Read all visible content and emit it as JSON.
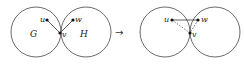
{
  "diagram": {
    "arrow": "→",
    "left": {
      "circles": [
        {
          "label": "G"
        },
        {
          "label": "H"
        }
      ],
      "vertices": {
        "u": "u",
        "v": "v",
        "w": "w"
      },
      "edges": [
        {
          "from": "u",
          "to": "v",
          "style": "solid"
        },
        {
          "from": "w",
          "to": "v",
          "style": "solid"
        }
      ]
    },
    "right": {
      "vertices": {
        "u": "u",
        "v": "v",
        "w": "w"
      },
      "edges": [
        {
          "from": "u",
          "to": "w",
          "style": "solid"
        },
        {
          "from": "u",
          "to": "v",
          "style": "dashed"
        },
        {
          "from": "w",
          "to": "v",
          "style": "dashed"
        }
      ]
    },
    "colors": {
      "stroke": "#333333",
      "vertex": "#111111"
    }
  }
}
